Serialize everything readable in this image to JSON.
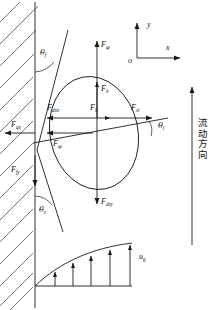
{
  "diagram": {
    "axes": {
      "origin_label": "o",
      "x_label": "x",
      "y_label": "y"
    },
    "angles": [
      {
        "name": "theta-upper",
        "symbol": "θ",
        "sub": "f"
      },
      {
        "name": "theta-lower",
        "symbol": "θ",
        "sub": "s"
      },
      {
        "name": "theta-right",
        "symbol": "θ",
        "sub": "i"
      }
    ],
    "forces": [
      {
        "name": "F-qp-up",
        "symbol": "F",
        "sub": "φ"
      },
      {
        "name": "F-h-up",
        "symbol": "F",
        "sub": "h"
      },
      {
        "name": "F-dsn-left",
        "symbol": "F",
        "sub": "dsn"
      },
      {
        "name": "F-h-right",
        "symbol": "F",
        "sub": "h"
      },
      {
        "name": "F-sl-right",
        "symbol": "F",
        "sub": "sl"
      },
      {
        "name": "F-qx-left",
        "symbol": "F",
        "sub": "qx"
      },
      {
        "name": "F-qp-low",
        "symbol": "F",
        "sub": "φ"
      },
      {
        "name": "F-fy-left",
        "symbol": "F",
        "sub": "fy"
      },
      {
        "name": "F-dsy-down",
        "symbol": "F",
        "sub": "dsy"
      }
    ],
    "velocity_profile": {
      "label_symbol": "u",
      "label_sub": "g",
      "arrow_count": 5
    },
    "flow_direction_text": "流动方向",
    "colors": {
      "stroke": "#1a1a1a",
      "background": "#ffffff"
    }
  }
}
